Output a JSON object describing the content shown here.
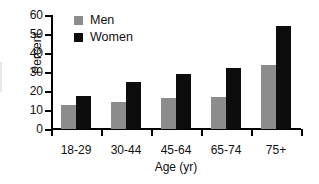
{
  "chart_data": {
    "type": "bar",
    "title": "",
    "subtitle": "",
    "xlabel": "Age (yr)",
    "ylabel": "Percent",
    "categories": [
      "18-29",
      "30-44",
      "45-64",
      "65-74",
      "75+"
    ],
    "series": [
      {
        "name": "Men",
        "color": "#8c8c8c",
        "values": [
          12.5,
          14,
          16.5,
          17,
          33.5
        ]
      },
      {
        "name": "Women",
        "color": "#0d0d0d",
        "values": [
          17.5,
          24.5,
          29,
          32,
          54
        ]
      }
    ],
    "ylim": [
      0,
      60
    ],
    "ytick_labels": [
      "60",
      "50",
      "40",
      "30",
      "20",
      "10",
      "0"
    ],
    "ytick_values": [
      60,
      50,
      40,
      30,
      20,
      10,
      0
    ],
    "grid": false,
    "legend_position": "top-left",
    "legend_entries": [
      "Men",
      "Women"
    ]
  },
  "axes": {
    "ylabel": "Percent",
    "xlabel": "Age (yr)"
  },
  "legend": {
    "men_label": "Men",
    "women_label": "Women"
  }
}
